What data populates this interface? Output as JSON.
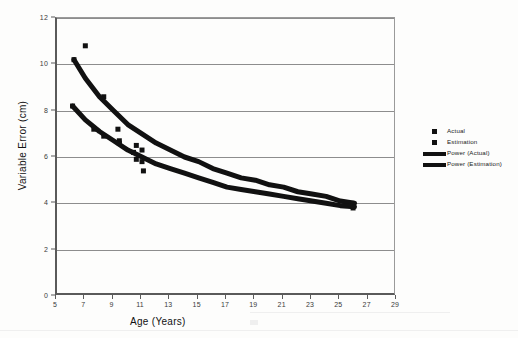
{
  "chart_data": {
    "type": "scatter",
    "title": "",
    "xlabel": "Age (Years)",
    "ylabel": "Variable Error (cm)",
    "xlim": [
      5,
      29
    ],
    "ylim": [
      0,
      12
    ],
    "xticks": [
      5,
      7,
      9,
      11,
      13,
      15,
      17,
      19,
      21,
      23,
      25,
      27,
      29
    ],
    "yticks": [
      0,
      2,
      4,
      6,
      8,
      10,
      12
    ],
    "grid": "horizontal",
    "legend_position": "right",
    "series": [
      {
        "name": "Actual",
        "type": "scatter",
        "marker": "square",
        "color": "#111111",
        "points": [
          [
            6.2,
            10.2
          ],
          [
            7.0,
            10.8
          ],
          [
            8.3,
            8.6
          ],
          [
            9.3,
            7.2
          ],
          [
            9.4,
            6.7
          ],
          [
            10.6,
            6.5
          ],
          [
            11.0,
            6.3
          ],
          [
            11.1,
            5.4
          ],
          [
            25.8,
            4.0
          ]
        ]
      },
      {
        "name": "Estimation",
        "type": "scatter",
        "marker": "square",
        "color": "#111111",
        "points": [
          [
            6.1,
            8.2
          ],
          [
            7.6,
            7.2
          ],
          [
            8.3,
            6.9
          ],
          [
            9.4,
            6.6
          ],
          [
            10.4,
            6.2
          ],
          [
            10.6,
            5.9
          ],
          [
            11.0,
            5.8
          ],
          [
            25.9,
            3.8
          ]
        ]
      },
      {
        "name": "Power (Actual)",
        "type": "line",
        "color": "#111111",
        "points": [
          [
            6.2,
            10.2
          ],
          [
            7.0,
            9.4
          ],
          [
            8.0,
            8.6
          ],
          [
            9.0,
            8.0
          ],
          [
            10.0,
            7.4
          ],
          [
            11.0,
            7.0
          ],
          [
            12.0,
            6.6
          ],
          [
            13.0,
            6.3
          ],
          [
            14.0,
            6.0
          ],
          [
            15.0,
            5.8
          ],
          [
            16.0,
            5.5
          ],
          [
            17.0,
            5.3
          ],
          [
            18.0,
            5.1
          ],
          [
            19.0,
            5.0
          ],
          [
            20.0,
            4.8
          ],
          [
            21.0,
            4.7
          ],
          [
            22.0,
            4.5
          ],
          [
            23.0,
            4.4
          ],
          [
            24.0,
            4.3
          ],
          [
            25.0,
            4.1
          ],
          [
            26.0,
            4.0
          ]
        ]
      },
      {
        "name": "Power (Estimation)",
        "type": "line",
        "color": "#111111",
        "points": [
          [
            6.1,
            8.2
          ],
          [
            7.0,
            7.6
          ],
          [
            8.0,
            7.1
          ],
          [
            9.0,
            6.7
          ],
          [
            10.0,
            6.3
          ],
          [
            11.0,
            6.0
          ],
          [
            12.0,
            5.7
          ],
          [
            13.0,
            5.5
          ],
          [
            14.0,
            5.3
          ],
          [
            15.0,
            5.1
          ],
          [
            16.0,
            4.9
          ],
          [
            17.0,
            4.7
          ],
          [
            18.0,
            4.6
          ],
          [
            19.0,
            4.5
          ],
          [
            20.0,
            4.4
          ],
          [
            21.0,
            4.3
          ],
          [
            22.0,
            4.2
          ],
          [
            23.0,
            4.1
          ],
          [
            24.0,
            4.0
          ],
          [
            25.0,
            3.9
          ],
          [
            26.0,
            3.85
          ]
        ]
      }
    ]
  },
  "legend": {
    "entries": [
      {
        "label": "Actual",
        "key": "square"
      },
      {
        "label": "Estimation",
        "key": "square"
      },
      {
        "label": "Power (Actual)",
        "key": "bar"
      },
      {
        "label": "Power (Estimation)",
        "key": "bar"
      }
    ]
  }
}
